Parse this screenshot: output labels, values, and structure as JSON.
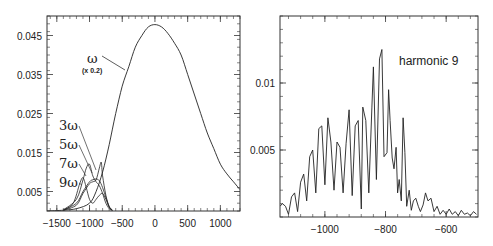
{
  "chart_data": [
    {
      "type": "line",
      "title": "",
      "xlabel": "",
      "ylabel": "",
      "xlim": [
        -1650,
        1300
      ],
      "ylim": [
        0,
        0.05
      ],
      "xticks": [
        -1500,
        -1000,
        -500,
        0,
        500,
        1000
      ],
      "xtick_labels": [
        "−1500",
        "−1000",
        "−500",
        "0",
        "500",
        "1000"
      ],
      "yticks": [
        0.005,
        0.015,
        0.025,
        0.035,
        0.045
      ],
      "ytick_labels": [
        "0.005",
        "0.015",
        "0.025",
        "0.035",
        "0.045"
      ],
      "grid": false,
      "annotations": [
        {
          "text": "ω",
          "sub": "(x 0.2)",
          "points_to": "fundamental"
        },
        {
          "text": "3ω"
        },
        {
          "text": "5ω"
        },
        {
          "text": "7ω"
        },
        {
          "text": "9ω"
        }
      ],
      "series": [
        {
          "name": "ω (x 0.2)",
          "x": [
            -1650,
            -1400,
            -1200,
            -1000,
            -900,
            -800,
            -700,
            -600,
            -500,
            -400,
            -300,
            -200,
            -100,
            0,
            100,
            200,
            300,
            400,
            500,
            600,
            700,
            800,
            900,
            1000,
            1100,
            1200,
            1300
          ],
          "y": [
            0,
            0.0002,
            0.0006,
            0.002,
            0.005,
            0.01,
            0.017,
            0.025,
            0.032,
            0.037,
            0.042,
            0.045,
            0.0472,
            0.0478,
            0.0472,
            0.0455,
            0.043,
            0.04,
            0.035,
            0.03,
            0.025,
            0.02,
            0.016,
            0.012,
            0.0095,
            0.0075,
            0.0055
          ]
        },
        {
          "name": "3ω",
          "x": [
            -1400,
            -1200,
            -1100,
            -1050,
            -1000,
            -950,
            -900,
            -850,
            -800,
            -750,
            -700,
            -650
          ],
          "y": [
            0.0003,
            0.003,
            0.008,
            0.011,
            0.012,
            0.009,
            0.0075,
            0.0065,
            0.0045,
            0.002,
            0.0006,
            0.0001
          ]
        },
        {
          "name": "5ω",
          "x": [
            -1400,
            -1200,
            -1100,
            -1000,
            -950,
            -900,
            -850,
            -800,
            -750,
            -700,
            -650
          ],
          "y": [
            0.0003,
            0.002,
            0.005,
            0.0075,
            0.008,
            0.0082,
            0.0078,
            0.006,
            0.0035,
            0.0012,
            0.0002
          ]
        },
        {
          "name": "7ω",
          "x": [
            -1400,
            -1200,
            -1100,
            -1000,
            -950,
            -900,
            -850,
            -820,
            -800,
            -750,
            -700,
            -650
          ],
          "y": [
            0.0002,
            0.0015,
            0.0045,
            0.007,
            0.0075,
            0.008,
            0.011,
            0.0125,
            0.009,
            0.004,
            0.001,
            0.0002
          ]
        },
        {
          "name": "9ω",
          "x": [
            -1400,
            -1250,
            -1150,
            -1100,
            -1050,
            -1000,
            -950,
            -900,
            -850,
            -800,
            -750,
            -700,
            -650
          ],
          "y": [
            0.0001,
            0.002,
            0.007,
            0.0085,
            0.006,
            0.003,
            0.002,
            0.003,
            0.004,
            0.0045,
            0.003,
            0.001,
            0.0002
          ]
        }
      ]
    },
    {
      "type": "line",
      "title": "",
      "xlabel": "",
      "ylabel": "",
      "xlim": [
        -1148,
        -495
      ],
      "ylim": [
        0,
        0.015
      ],
      "xticks": [
        -1000,
        -800,
        -600
      ],
      "xtick_labels": [
        "−1000",
        "−800",
        "−600"
      ],
      "yticks": [
        0.005,
        0.01
      ],
      "ytick_labels": [
        "0.005",
        "0.01"
      ],
      "grid": false,
      "annotations": [
        {
          "text": "harmonic 9"
        }
      ],
      "series": [
        {
          "name": "harmonic 9",
          "x": [
            -1148,
            -1140,
            -1130,
            -1120,
            -1110,
            -1100,
            -1090,
            -1080,
            -1070,
            -1060,
            -1050,
            -1040,
            -1030,
            -1020,
            -1010,
            -1000,
            -990,
            -980,
            -970,
            -960,
            -950,
            -940,
            -930,
            -920,
            -910,
            -900,
            -890,
            -880,
            -875,
            -865,
            -855,
            -845,
            -840,
            -830,
            -820,
            -812,
            -805,
            -795,
            -790,
            -785,
            -778,
            -772,
            -765,
            -760,
            -755,
            -748,
            -742,
            -736,
            -730,
            -722,
            -715,
            -708,
            -700,
            -692,
            -685,
            -676,
            -668,
            -660,
            -650,
            -640,
            -630,
            -620,
            -610,
            -600,
            -590,
            -580,
            -570,
            -560,
            -550,
            -540,
            -530,
            -520,
            -510,
            -500
          ],
          "y": [
            0.0008,
            0.001,
            0.0008,
            0.0002,
            0.0015,
            0.0018,
            0.0004,
            0.0026,
            0.0032,
            0.0012,
            0.0045,
            0.005,
            0.0018,
            0.0066,
            0.0068,
            0.0024,
            0.0074,
            0.0056,
            0.002,
            0.0056,
            0.0052,
            0.0018,
            0.0055,
            0.008,
            0.0016,
            0.0068,
            0.0072,
            0.0006,
            0.0082,
            0.0072,
            0.0018,
            0.0082,
            0.0112,
            0.0028,
            0.0118,
            0.0125,
            0.0045,
            0.0048,
            0.0095,
            0.0072,
            0.0044,
            0.0036,
            0.0052,
            0.0018,
            0.0028,
            0.0012,
            0.0074,
            0.0048,
            0.0008,
            0.002,
            0.0005,
            0.0012,
            0.0014,
            0.0008,
            0.0004,
            0.0009,
            0.0018,
            0.0012,
            0.0014,
            0.0004,
            0.0008,
            0.0002,
            0.0005,
            0.0002,
            0.0006,
            0.0002,
            0.0004,
            0.0001,
            0.0005,
            0.0002,
            0.0003,
            0.0001,
            0.0004,
            0.0002
          ]
        }
      ]
    }
  ],
  "labels": {
    "left": {
      "omega": "ω",
      "omega_scale": "(x 0.2)",
      "h3": "3ω",
      "h5": "5ω",
      "h7": "7ω",
      "h9": "9ω"
    },
    "right": {
      "title": "harmonic 9"
    }
  },
  "colors": {
    "line": "#222222",
    "frame": "#333333",
    "background": "#ffffff"
  }
}
